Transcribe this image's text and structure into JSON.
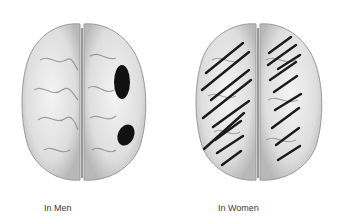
{
  "figure": {
    "panels": [
      {
        "label": "In Men",
        "annotation": "two dark filled spots on right hemisphere",
        "colors": {
          "brain": "#e6e6e6",
          "marker": "#111111"
        }
      },
      {
        "label": "In Women",
        "annotation": "diagonal hatching across both hemispheres",
        "colors": {
          "brain": "#e6e6e6",
          "marker": "#111111"
        }
      }
    ]
  }
}
